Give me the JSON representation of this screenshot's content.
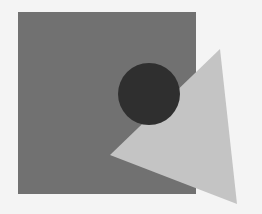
{
  "canvas": {
    "width": 262,
    "height": 214,
    "background": "#f4f4f4"
  },
  "shapes": {
    "square": {
      "x": 18,
      "y": 12,
      "width": 178,
      "height": 182,
      "fill": "#717171"
    },
    "triangle": {
      "points": "220,49 110,155 237,204",
      "fill": "#c4c4c4"
    },
    "circle": {
      "cx": 149,
      "cy": 94,
      "r": 31,
      "fill": "#2f2f2f"
    }
  }
}
